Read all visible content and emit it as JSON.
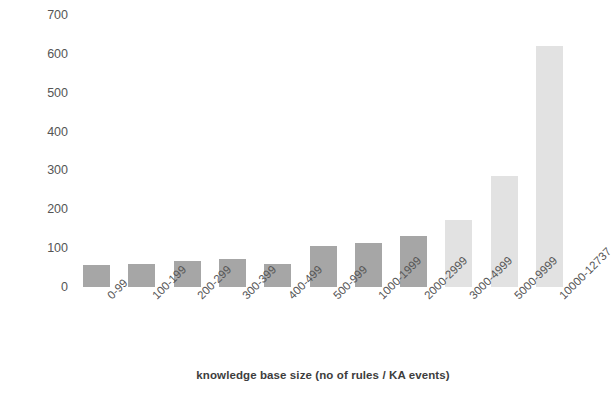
{
  "chart_data": {
    "type": "bar",
    "title": "",
    "xlabel": "knowledge base size (no of rules / KA events)",
    "ylabel": "median time in seconds",
    "categories": [
      "0-99",
      "100-199",
      "200-299",
      "300-399",
      "400-499",
      "500-999",
      "1000-1999",
      "2000-2999",
      "3000-4999",
      "5000-9999",
      "10000-12737"
    ],
    "values": [
      57,
      60,
      67,
      72,
      60,
      106,
      112,
      132,
      172,
      285,
      620
    ],
    "bar_colors": [
      "#a6a6a6",
      "#a6a6a6",
      "#a6a6a6",
      "#a6a6a6",
      "#a6a6a6",
      "#a6a6a6",
      "#a6a6a6",
      "#a6a6a6",
      "#e2e2e2",
      "#e2e2e2",
      "#e2e2e2"
    ],
    "ylim": [
      0,
      700
    ],
    "ytick_labels": [
      "0",
      "100",
      "200",
      "300",
      "400",
      "500",
      "600",
      "700"
    ],
    "ytick_values": [
      0,
      100,
      200,
      300,
      400,
      500,
      600,
      700
    ],
    "grid": false,
    "legend": null,
    "background_color": "#ffffff"
  }
}
